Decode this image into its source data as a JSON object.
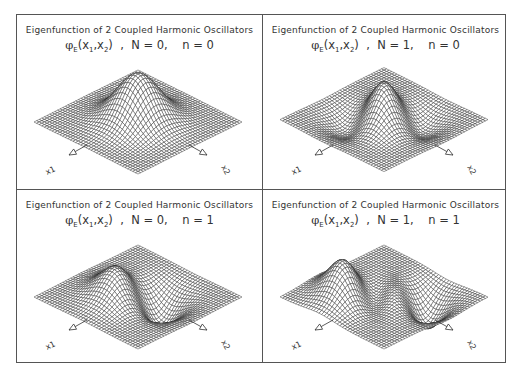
{
  "chart_data": [
    {
      "type": "surface",
      "title": "Eigenfunction of 2 Coupled Harmonic Oscillators",
      "subtitle": "φE(x1,x2) , N = 0, n = 0",
      "N": 0,
      "n": 0,
      "axes": {
        "x": "x1",
        "y": "x2"
      },
      "shape": "single central gaussian peak"
    },
    {
      "type": "surface",
      "title": "Eigenfunction of 2 Coupled Harmonic Oscillators",
      "subtitle": "φE(x1,x2) , N = 1, n = 0",
      "N": 1,
      "n": 0,
      "axes": {
        "x": "x1",
        "y": "x2"
      },
      "shape": "central ridge with flanking troughs along x1-x2 diagonal"
    },
    {
      "type": "surface",
      "title": "Eigenfunction of 2 Coupled Harmonic Oscillators",
      "subtitle": "φE(x1,x2) , N = 0, n = 1",
      "N": 0,
      "n": 1,
      "axes": {
        "x": "x1",
        "y": "x2"
      },
      "shape": "two lobes (one peak, one trough) with nodal line"
    },
    {
      "type": "surface",
      "title": "Eigenfunction of 2 Coupled Harmonic Oscillators",
      "subtitle": "φE(x1,x2) , N = 1, n = 1",
      "N": 1,
      "n": 1,
      "axes": {
        "x": "x1",
        "y": "x2"
      },
      "shape": "two peaks separated by a deep trough"
    }
  ],
  "panels": [
    {
      "title": "Eigenfunction of 2 Coupled Harmonic Oscillators",
      "func": "φ",
      "sub_E": "E",
      "args": "(x",
      "N_label": "N = 0,",
      "n_label": "n = 0",
      "x1": "x1",
      "x2": "x2"
    },
    {
      "title": "Eigenfunction of 2 Coupled Harmonic Oscillators",
      "func": "φ",
      "sub_E": "E",
      "args": "(x",
      "N_label": "N = 1,",
      "n_label": "n = 0",
      "x1": "x1",
      "x2": "x2"
    },
    {
      "title": "Eigenfunction of 2 Coupled Harmonic Oscillators",
      "func": "φ",
      "sub_E": "E",
      "args": "(x",
      "N_label": "N = 0,",
      "n_label": "n = 1",
      "x1": "x1",
      "x2": "x2"
    },
    {
      "title": "Eigenfunction of 2 Coupled Harmonic Oscillators",
      "func": "φ",
      "sub_E": "E",
      "args": "(x",
      "N_label": "N = 1,",
      "n_label": "n = 1",
      "x1": "x1",
      "x2": "x2"
    }
  ]
}
